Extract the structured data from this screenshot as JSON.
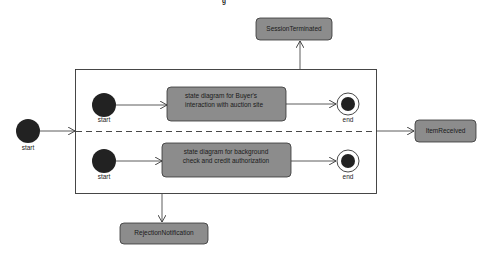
{
  "diagram": {
    "type": "uml-state-diagram",
    "title_fragment": "g",
    "colors": {
      "state_fill": "#8c8c8c",
      "state_stroke": "#333333",
      "pseudostate_fill": "#222222",
      "line": "#333333",
      "background": "#ffffff"
    },
    "outer_start": {
      "label": "start"
    },
    "composite_state": {
      "regions": [
        {
          "start_label": "start",
          "state_lines": [
            "state diagram for Buyer's",
            "interaction with auction site"
          ],
          "end_label": "end"
        },
        {
          "start_label": "start",
          "state_lines": [
            "state diagram for background",
            "check and credit authorization"
          ],
          "end_label": "end"
        }
      ]
    },
    "external_states": {
      "session_terminated": "SessionTerminated",
      "item_received": "ItemReceived",
      "rejection_notification": "RejectionNotification"
    }
  }
}
